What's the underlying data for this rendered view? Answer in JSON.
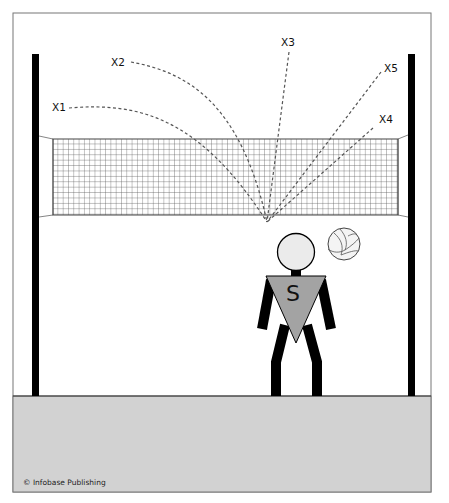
{
  "diagram": {
    "labels": {
      "x1": "X1",
      "x2": "X2",
      "x3": "X3",
      "x4": "X4",
      "x5": "X5"
    },
    "player_letter": "S",
    "credit": "© Infobase Publishing",
    "colors": {
      "frame": "#777777",
      "ground": "#d2d2d2",
      "pole": "#000000",
      "net_grid": "#555555",
      "jersey": "#a3a3a3",
      "head": "#ebebeb",
      "trajectory": "#555555"
    }
  }
}
